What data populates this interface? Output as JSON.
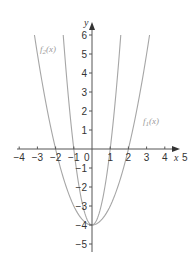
{
  "chart_data": {
    "type": "line",
    "title": "",
    "xlabel": "x",
    "ylabel": "y",
    "xlim": [
      -4,
      5
    ],
    "ylim": [
      -5,
      6
    ],
    "grid": false,
    "x_ticks": [
      "-4",
      "-3",
      "-2",
      "-1",
      "1",
      "2",
      "3",
      "4",
      "5"
    ],
    "y_ticks": [
      "6",
      "5",
      "4",
      "3",
      "2",
      "1",
      "-1",
      "-2",
      "-3",
      "-4",
      "-5"
    ],
    "origin_label": "0",
    "series": [
      {
        "name": "f1(x)",
        "label": "f",
        "subscript": "1",
        "arg": "(x)",
        "expression": "x^2 - 4",
        "a": 1,
        "c": -4,
        "x_intercepts": [
          -2,
          2
        ],
        "vertex": [
          0,
          -4
        ]
      },
      {
        "name": "f2(x)",
        "label": "f",
        "subscript": "2",
        "arg": "(x)",
        "expression": "4x^2 - 4",
        "a": 4,
        "c": -4,
        "x_intercepts": [
          -1,
          1
        ],
        "vertex": [
          0,
          -4
        ]
      }
    ],
    "colors": {
      "curve": "#a6a6a6",
      "axis": "#555555",
      "label": "#9a9a9a"
    }
  }
}
